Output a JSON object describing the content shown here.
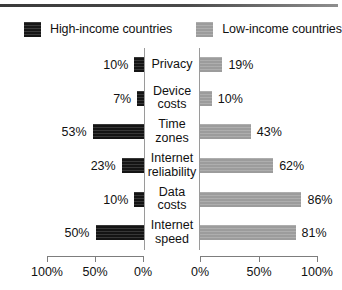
{
  "legend": {
    "items": [
      {
        "label": "High-income countries",
        "swatch": "dark-swatch-icon",
        "color": "#141414"
      },
      {
        "label": "Low-income countries",
        "swatch": "light-swatch-icon",
        "color": "#9c9c9c"
      }
    ]
  },
  "axis": {
    "left_ticks": [
      "100%",
      "50%",
      "0%"
    ],
    "right_ticks": [
      "0%",
      "50%",
      "100%"
    ]
  },
  "chart_data": {
    "type": "bar",
    "title": "",
    "subtitle": "",
    "xlabel": "",
    "ylabel": "",
    "orientation": "horizontal",
    "layout": "diverging-tornado",
    "grid": false,
    "legend_position": "top",
    "xlim_left": [
      100,
      0
    ],
    "xlim_right": [
      0,
      100
    ],
    "categories": [
      "Privacy",
      "Device costs",
      "Time zones",
      "Internet reliability",
      "Data costs",
      "Internet speed"
    ],
    "series": [
      {
        "name": "High-income countries",
        "side": "left",
        "color": "#141414",
        "values": [
          10,
          7,
          53,
          23,
          10,
          50
        ],
        "labels": [
          "10%",
          "7%",
          "53%",
          "23%",
          "10%",
          "50%"
        ]
      },
      {
        "name": "Low-income countries",
        "side": "right",
        "color": "#9c9c9c",
        "values": [
          19,
          10,
          43,
          62,
          86,
          81
        ],
        "labels": [
          "19%",
          "10%",
          "43%",
          "62%",
          "86%",
          "81%"
        ]
      }
    ]
  }
}
